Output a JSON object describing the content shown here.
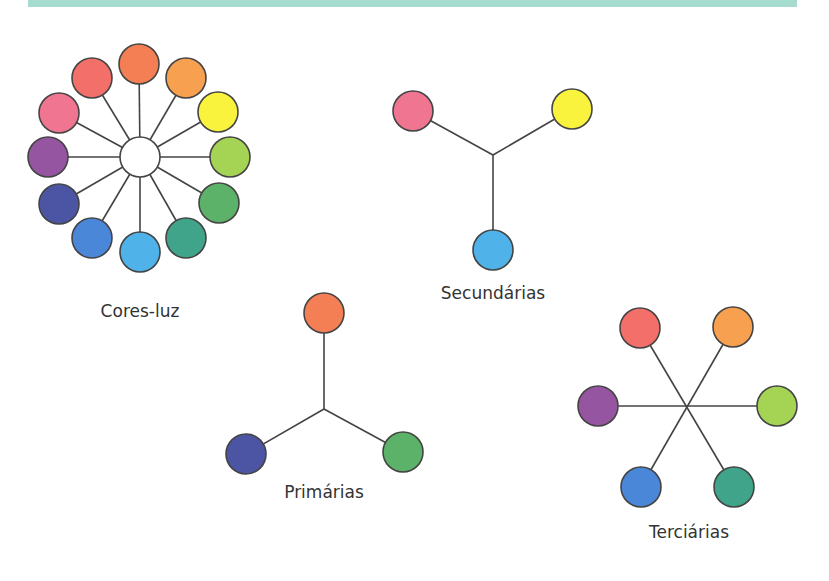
{
  "header_band": {
    "color": "#a6dccf"
  },
  "stroke_color": "#444444",
  "diagrams": {
    "cores_luz": {
      "label": "Cores-luz",
      "label_pos": [
        140,
        311
      ],
      "center": {
        "x": 140,
        "y": 157,
        "r": 20,
        "color": "#ffffff"
      },
      "circles": [
        {
          "name": "orange-red",
          "x": 139,
          "y": 64,
          "color": "#f47f55"
        },
        {
          "name": "orange",
          "x": 186,
          "y": 78,
          "color": "#f7a04f"
        },
        {
          "name": "yellow",
          "x": 218,
          "y": 112,
          "color": "#f9f33e"
        },
        {
          "name": "lime",
          "x": 230,
          "y": 157,
          "color": "#a5d454"
        },
        {
          "name": "green",
          "x": 219,
          "y": 203,
          "color": "#5bb268"
        },
        {
          "name": "teal",
          "x": 186,
          "y": 238,
          "color": "#3fa48a"
        },
        {
          "name": "light-blue",
          "x": 140,
          "y": 252,
          "color": "#4fb2e8"
        },
        {
          "name": "blue",
          "x": 92,
          "y": 238,
          "color": "#4a87d8"
        },
        {
          "name": "indigo",
          "x": 59,
          "y": 204,
          "color": "#4b55a4"
        },
        {
          "name": "purple",
          "x": 48,
          "y": 157,
          "color": "#9655a0"
        },
        {
          "name": "pink",
          "x": 59,
          "y": 113,
          "color": "#ef7590"
        },
        {
          "name": "coral",
          "x": 92,
          "y": 78,
          "color": "#f26f6a"
        }
      ]
    },
    "secundarias": {
      "label": "Secundárias",
      "label_pos": [
        493,
        293
      ],
      "junction": {
        "x": 493,
        "y": 155
      },
      "circles": [
        {
          "name": "pink",
          "x": 413,
          "y": 111,
          "color": "#ef7590"
        },
        {
          "name": "yellow",
          "x": 572,
          "y": 109,
          "color": "#f9f33e"
        },
        {
          "name": "light-blue",
          "x": 493,
          "y": 250,
          "color": "#4fb2e8"
        }
      ]
    },
    "primarias": {
      "label": "Primárias",
      "label_pos": [
        324,
        492
      ],
      "junction": {
        "x": 324,
        "y": 409
      },
      "circles": [
        {
          "name": "orange-red",
          "x": 324,
          "y": 313,
          "color": "#f47f55"
        },
        {
          "name": "indigo",
          "x": 246,
          "y": 454,
          "color": "#4b55a4"
        },
        {
          "name": "green",
          "x": 403,
          "y": 452,
          "color": "#5bb268"
        }
      ]
    },
    "terciarias": {
      "label": "Terciárias",
      "label_pos": [
        689,
        532
      ],
      "junction": {
        "x": 687,
        "y": 406
      },
      "circles": [
        {
          "name": "coral",
          "x": 640,
          "y": 328,
          "color": "#f26f6a"
        },
        {
          "name": "orange",
          "x": 733,
          "y": 327,
          "color": "#f7a04f"
        },
        {
          "name": "purple",
          "x": 598,
          "y": 406,
          "color": "#9655a0"
        },
        {
          "name": "lime",
          "x": 777,
          "y": 406,
          "color": "#a5d454"
        },
        {
          "name": "blue",
          "x": 641,
          "y": 487,
          "color": "#4a87d8"
        },
        {
          "name": "teal",
          "x": 734,
          "y": 487,
          "color": "#3fa48a"
        }
      ]
    }
  },
  "circle_radius": 20
}
